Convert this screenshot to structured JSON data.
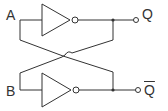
{
  "diagram": {
    "type": "cross-coupled inverter latch",
    "inputs": [
      {
        "label": "A"
      },
      {
        "label": "B"
      }
    ],
    "outputs": [
      {
        "label": "Q"
      },
      {
        "label": "Q",
        "overline": true
      }
    ],
    "colors": {
      "stroke": "#333333",
      "background": "#ffffff"
    }
  }
}
